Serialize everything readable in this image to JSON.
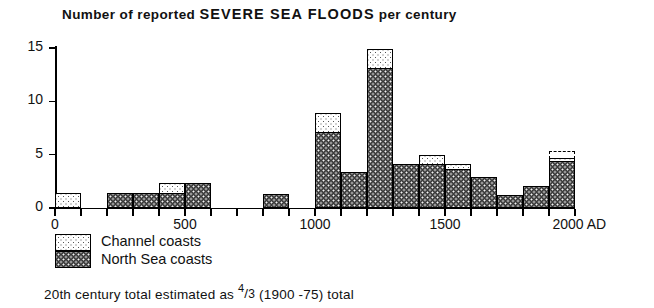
{
  "title": {
    "part1": "Number of reported ",
    "emphasis": "SEVERE  SEA  FLOODS",
    "part2": " per century"
  },
  "legend": {
    "channel": "Channel coasts",
    "north": "North Sea coasts"
  },
  "footnote": {
    "lead": "20th century  total  estimated  as ",
    "num": "4",
    "slash": "/",
    "den": "3",
    "tail": "  (1900 -75)  total"
  },
  "axes": {
    "y_ticks": [
      0,
      5,
      10,
      15
    ],
    "y_labels": [
      "0",
      "5",
      "10",
      "15"
    ],
    "x_labels": [
      "0",
      "500",
      "1000",
      "1500",
      "2000 AD"
    ],
    "x_label_values": [
      0,
      500,
      1000,
      1500,
      2000
    ],
    "x_tick_values": [
      0,
      100,
      200,
      300,
      400,
      500,
      600,
      700,
      800,
      900,
      1000,
      1100,
      1200,
      1300,
      1400,
      1500,
      1600,
      1700,
      1800,
      1900,
      2000
    ]
  },
  "colors": {
    "north_sea": "#3a3a3a",
    "channel": "#ffffff",
    "outline": "#000000"
  },
  "chart_data": {
    "type": "bar",
    "title": "Number of reported SEVERE SEA FLOODS per century",
    "xlabel": "2000 AD",
    "ylabel": "",
    "xlim": [
      0,
      2000
    ],
    "ylim": [
      0,
      15
    ],
    "grid": false,
    "legend_position": "below-axes",
    "bin_width": 100,
    "categories": [
      "0-100",
      "100-200",
      "200-300",
      "300-400",
      "400-500",
      "500-600",
      "600-700",
      "700-800",
      "800-900",
      "900-1000",
      "1000-1100",
      "1100-1200",
      "1200-1300",
      "1300-1400",
      "1400-1500",
      "1500-1600",
      "1600-1700",
      "1700-1800",
      "1800-1900",
      "1900-2000"
    ],
    "bin_starts": [
      0,
      100,
      200,
      300,
      400,
      500,
      600,
      700,
      800,
      900,
      1000,
      1100,
      1200,
      1300,
      1400,
      1500,
      1600,
      1700,
      1800,
      1900
    ],
    "series": [
      {
        "name": "North Sea coasts",
        "values": [
          0,
          0,
          1.3,
          1.3,
          1.3,
          2.2,
          0,
          0,
          1.2,
          0,
          7,
          3.2,
          13,
          4,
          4,
          3.6,
          2.8,
          1.1,
          1.9,
          4.3
        ]
      },
      {
        "name": "Channel coasts",
        "values": [
          1.3,
          0,
          0,
          0,
          0.9,
          0,
          0,
          0,
          0,
          0,
          1.8,
          0,
          1.8,
          0,
          0.8,
          0.4,
          0,
          0,
          0,
          0.3
        ]
      },
      {
        "name": "20th century estimate (dashed)",
        "values": [
          0,
          0,
          0,
          0,
          0,
          0,
          0,
          0,
          0,
          0,
          0,
          0,
          0,
          0,
          0,
          0,
          0,
          0,
          0,
          0.6
        ]
      }
    ],
    "totals": [
      1.3,
      0,
      1.3,
      1.3,
      2.2,
      2.2,
      0,
      0,
      1.2,
      0,
      8.8,
      3.2,
      14.8,
      4,
      4.8,
      4,
      2.8,
      1.1,
      1.9,
      5.2
    ],
    "annotation": "20th century total estimated as 4/3 (1900-75) total"
  }
}
